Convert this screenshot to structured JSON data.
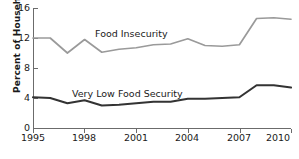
{
  "chart_data": {
    "type": "line",
    "title": "",
    "xlabel": "",
    "ylabel": "Percent of Households",
    "xlim": [
      1995,
      2010
    ],
    "ylim": [
      0,
      16
    ],
    "ytick_labels": [
      "0",
      "4",
      "8",
      "12",
      "16"
    ],
    "yticks": [
      0,
      4,
      8,
      12,
      16
    ],
    "xtick_labels": [
      "1995",
      "1998",
      "2001",
      "2004",
      "2007",
      "2010"
    ],
    "xticks": [
      1995,
      1998,
      2001,
      2004,
      2007,
      2010
    ],
    "grid": false,
    "legend_position": "inline-annotation",
    "x": [
      1995,
      1996,
      1997,
      1998,
      1999,
      2000,
      2001,
      2002,
      2003,
      2004,
      2005,
      2006,
      2007,
      2008,
      2009,
      2010
    ],
    "series": [
      {
        "name": "Food Insecurity",
        "color": "#9a9a9a",
        "values": [
          12.0,
          12.0,
          10.0,
          11.8,
          10.1,
          10.5,
          10.7,
          11.1,
          11.2,
          11.9,
          11.0,
          10.9,
          11.1,
          14.6,
          14.7,
          14.5
        ]
      },
      {
        "name": "Very Low Food Security",
        "color": "#333333",
        "values": [
          4.1,
          4.0,
          3.3,
          3.7,
          3.0,
          3.1,
          3.3,
          3.5,
          3.5,
          3.9,
          3.9,
          4.0,
          4.1,
          5.7,
          5.7,
          5.4
        ]
      }
    ],
    "annotations": [
      {
        "name": "food-insecurity-label",
        "text": "Food Insecurity"
      },
      {
        "name": "very-low-food-security-label",
        "text": "Very Low Food Security"
      }
    ]
  }
}
